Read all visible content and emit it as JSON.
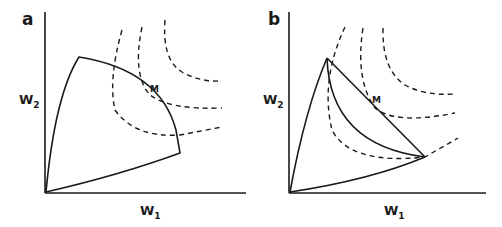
{
  "figure": {
    "panels": [
      {
        "letter": "a",
        "x_label": "W",
        "x_sub": "1",
        "y_label": "W",
        "y_sub": "2",
        "point_label": "M",
        "description": "Convex feasible frontier tangent to indifference curves at M"
      },
      {
        "letter": "b",
        "x_label": "W",
        "x_sub": "1",
        "y_label": "W",
        "y_sub": "2",
        "point_label": "M",
        "description": "Concave frontier with linear chord; M on the chord between extremes"
      }
    ],
    "colors": {
      "line": "#1a1a1a",
      "background": "#ffffff"
    }
  }
}
